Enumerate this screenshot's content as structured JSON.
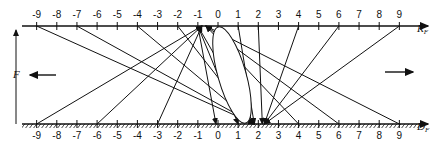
{
  "diagram": {
    "title": "",
    "top_axis": {
      "name": "R",
      "subscript": "F",
      "ticks": [
        "-9",
        "-8",
        "-7",
        "-6",
        "-5",
        "-4",
        "-3",
        "-2",
        "-1",
        "0",
        "1",
        "2",
        "3",
        "4",
        "5",
        "6",
        "7",
        "8",
        "9"
      ]
    },
    "bottom_axis": {
      "name": "D",
      "subscript": "F",
      "ticks": [
        "-9",
        "-8",
        "-7",
        "-6",
        "-5",
        "-4",
        "-3",
        "-2",
        "-1",
        "0",
        "1",
        "2",
        "3",
        "4",
        "5",
        "6",
        "7",
        "8",
        "9"
      ]
    },
    "force_label": "F",
    "left_arrow": "arrow-left",
    "right_arrow": "arrow-right",
    "ellipse": {
      "description": "tilted ellipse spanning from top axis near 0 to bottom axis near 2"
    },
    "connections": [
      {
        "from_top": -9,
        "to_bottom": 1.8
      },
      {
        "from_top": -7,
        "to_bottom": 1.8
      },
      {
        "from_top": -4,
        "to_bottom": 1.8
      },
      {
        "from_top": -2,
        "to_bottom": 1.8
      },
      {
        "from_top": -1,
        "to_bottom": -0.1
      },
      {
        "from_top": -1,
        "to_bottom": 1
      },
      {
        "from_top": -1,
        "to_bottom": 1.8
      },
      {
        "from_top": 1,
        "to_bottom": 1.8
      },
      {
        "from_top": 2,
        "to_bottom": 2.2
      },
      {
        "from_top": 4,
        "to_bottom": 2.3
      },
      {
        "from_top": 6,
        "to_bottom": 2.3
      },
      {
        "from_top": 9,
        "to_bottom": 2.3
      },
      {
        "from_bottom": -9,
        "to_top": -0.8
      },
      {
        "from_bottom": -6,
        "to_top": -0.8
      },
      {
        "from_bottom": -3,
        "to_top": -0.8
      },
      {
        "from_bottom": 4,
        "to_top": -0.6
      },
      {
        "from_bottom": 6,
        "to_top": -0.6
      },
      {
        "from_bottom": 9,
        "to_top": -0.6
      }
    ]
  }
}
